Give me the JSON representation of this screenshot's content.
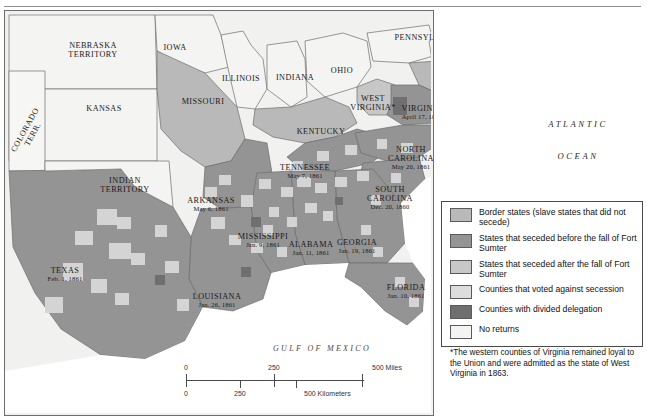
{
  "map": {
    "title_region": "United States secession map, 1860-1861",
    "states": [
      {
        "name": "NEBRASKA",
        "line2": "TERRITORY",
        "date": "",
        "x": 88,
        "y": 30,
        "cls": "state"
      },
      {
        "name": "IOWA",
        "line2": "",
        "date": "",
        "x": 170,
        "y": 32,
        "cls": "state"
      },
      {
        "name": "ILLINOIS",
        "line2": "",
        "date": "",
        "x": 236,
        "y": 63,
        "cls": "state"
      },
      {
        "name": "INDIAN",
        "line2": "TERRITORY",
        "date": "",
        "x": 120,
        "y": 165,
        "cls": "state"
      },
      {
        "name": "INDIANA",
        "line2": "",
        "date": "",
        "x": 290,
        "y": 62,
        "cls": "state"
      },
      {
        "name": "OHIO",
        "line2": "",
        "date": "",
        "x": 337,
        "y": 55,
        "cls": "state"
      },
      {
        "name": "PENNSYLVANIA",
        "line2": "",
        "date": "",
        "x": 423,
        "y": 22,
        "cls": "state"
      },
      {
        "name": "NEW JERSEY",
        "line2": "",
        "date": "",
        "x": 489,
        "y": 34,
        "cls": "state"
      },
      {
        "name": "DELAWARE",
        "line2": "",
        "date": "",
        "x": 474,
        "y": 58,
        "cls": "state"
      },
      {
        "name": "MARYLAND",
        "line2": "",
        "date": "",
        "x": 473,
        "y": 70,
        "cls": "state"
      },
      {
        "name": "WASHINGTON, D.C.",
        "line2": "",
        "date": "",
        "x": 489,
        "y": 82,
        "cls": "state"
      },
      {
        "name": "KANSAS",
        "line2": "",
        "date": "",
        "x": 99,
        "y": 93,
        "cls": "state"
      },
      {
        "name": "MISSOURI",
        "line2": "",
        "date": "",
        "x": 198,
        "y": 86,
        "cls": "state"
      },
      {
        "name": "KENTUCKY",
        "line2": "",
        "date": "",
        "x": 316,
        "y": 116,
        "cls": "state"
      },
      {
        "name": "WEST",
        "line2": "VIRGINIA*",
        "date": "",
        "x": 368,
        "y": 83,
        "cls": "state"
      },
      {
        "name": "VIRGINIA",
        "line2": "",
        "date": "April 17, 1861",
        "x": 417,
        "y": 93,
        "cls": "state"
      },
      {
        "name": "NORTH",
        "line2": "CAROLINA",
        "date": "May 20, 1861",
        "x": 406,
        "y": 134,
        "cls": "state"
      },
      {
        "name": "TENNESSEE",
        "line2": "",
        "date": "May 7, 1861",
        "x": 300,
        "y": 152,
        "cls": "state"
      },
      {
        "name": "SOUTH",
        "line2": "CAROLINA",
        "date": "Dec. 20, 1860",
        "x": 385,
        "y": 174,
        "cls": "state"
      },
      {
        "name": "ARKANSAS",
        "line2": "",
        "date": "May 6, 1861",
        "x": 206,
        "y": 185,
        "cls": "state"
      },
      {
        "name": "MISSISSIPPI",
        "line2": "",
        "date": "Jan. 9, 1861",
        "x": 258,
        "y": 221,
        "cls": "state"
      },
      {
        "name": "ALABAMA",
        "line2": "",
        "date": "Jan. 11, 1861",
        "x": 306,
        "y": 229,
        "cls": "state"
      },
      {
        "name": "GEORGIA",
        "line2": "",
        "date": "Jan. 19, 1861",
        "x": 352,
        "y": 227,
        "cls": "state"
      },
      {
        "name": "FLORIDA",
        "line2": "",
        "date": "Jan. 10, 1861",
        "x": 401,
        "y": 272,
        "cls": "state"
      },
      {
        "name": "LOUISIANA",
        "line2": "",
        "date": "Jan. 26, 1861",
        "x": 212,
        "y": 281,
        "cls": "state"
      },
      {
        "name": "TEXAS",
        "line2": "",
        "date": "Feb. 1, 1861",
        "x": 60,
        "y": 255,
        "cls": "state"
      }
    ],
    "rotated_label": {
      "line1": "COLORADO",
      "line2": "TERR.",
      "x": 24,
      "y": 112
    },
    "water_labels": [
      {
        "text": "ATLANTIC",
        "x": 578,
        "y": 120,
        "cls": "ocean"
      },
      {
        "text": "OCEAN",
        "x": 578,
        "y": 152,
        "cls": "ocean"
      },
      {
        "text": "GULF OF MEXICO",
        "x": 322,
        "y": 345,
        "cls": "gulf"
      }
    ]
  },
  "legend": {
    "items": [
      {
        "label": "Border states (slave states that did not secede)",
        "color": "#b9b9b9",
        "name": "border-states"
      },
      {
        "label": "States that seceded before the fall of Fort Sumter",
        "color": "#949494",
        "name": "seceded-before-sumter"
      },
      {
        "label": "States that seceded after the fall of Fort Sumter",
        "color": "#c7c7c7",
        "name": "seceded-after-sumter"
      },
      {
        "label": "Counties that voted against secession",
        "color": "#dcdcdc",
        "name": "counties-against-secession"
      },
      {
        "label": "Counties with divided delegation",
        "color": "#6f6f6f",
        "name": "counties-divided-delegation"
      },
      {
        "label": "No returns",
        "color": "#f3f3f1",
        "name": "no-returns"
      }
    ],
    "footnote": "*The western counties of Virginia remained loyal to the Union and were admitted as the state of West Virginia in 1863."
  },
  "scale": {
    "miles": {
      "start": "0",
      "mid": "250",
      "end": "500 Miles"
    },
    "kilometers": {
      "start": "0",
      "mid": "250",
      "end": "500 Kilometers"
    }
  },
  "colors": {
    "border_state": "#b9b9b9",
    "seceded_before": "#949494",
    "seceded_after": "#c7c7c7",
    "county_against": "#dcdcdc",
    "divided": "#6f6f6f",
    "no_returns": "#f3f3f1",
    "union_free": "#f1f1ef",
    "water": "#ffffff",
    "outline": "#6d6d6d"
  }
}
